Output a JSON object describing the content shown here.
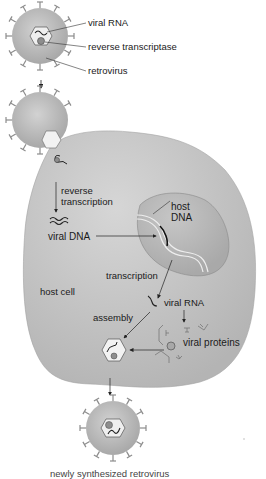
{
  "diagram": {
    "type": "retrovirus life cycle",
    "colors": {
      "virus_fill": "#b9b9b9",
      "virus_spikes": "#8c8c8c",
      "cell_fill": "#c4c4c4",
      "nucleus_fill": "#b0b0b0",
      "capsid_fill": "#efefef",
      "line": "#222222",
      "background": "#ffffff"
    },
    "labels": {
      "viral_rna_top": "viral RNA",
      "reverse_transcriptase": "reverse transcriptase",
      "retrovirus": "retrovirus",
      "reverse_transcription_1": "reverse",
      "reverse_transcription_2": "transcription",
      "host_dna_1": "host",
      "host_dna_2": "DNA",
      "viral_dna": "viral DNA",
      "transcription": "transcription",
      "host_cell": "host cell",
      "viral_rna_cell": "viral RNA",
      "assembly": "assembly",
      "viral_proteins": "viral proteins",
      "caption": "newly synthesized retrovirus"
    },
    "stages": [
      "retrovirus",
      "entry into host cell",
      "reverse transcription",
      "integration into host DNA",
      "transcription",
      "viral proteins",
      "assembly",
      "newly synthesized retrovirus"
    ]
  }
}
